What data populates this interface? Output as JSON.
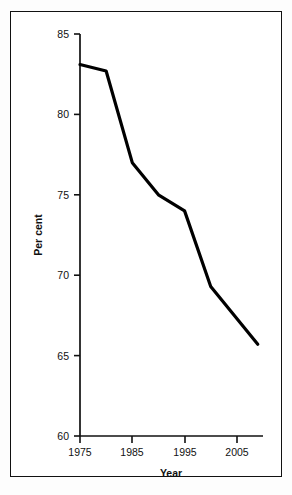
{
  "figure": {
    "frame_color": "#111111",
    "background": "#ffffff"
  },
  "caption_sliver": "",
  "chart_data": {
    "type": "line",
    "title": "",
    "xlabel": "Year",
    "ylabel": "Per cent",
    "xlim": [
      1975,
      2010
    ],
    "ylim": [
      60,
      85
    ],
    "xticks": [
      1975,
      1985,
      1995,
      2005
    ],
    "xtick_labels": [
      "1975",
      "1985",
      "1995",
      "2005"
    ],
    "yticks": [
      60,
      65,
      70,
      75,
      80,
      85
    ],
    "ytick_labels": [
      "60",
      "65",
      "70",
      "75",
      "80",
      "85"
    ],
    "grid": false,
    "legend": false,
    "line_color": "#000000",
    "line_width": 3.2,
    "series": [
      {
        "name": "Per cent",
        "x": [
          1975,
          1980,
          1985,
          1990,
          1995,
          2000,
          2009
        ],
        "values": [
          83.1,
          82.7,
          77.0,
          75.0,
          74.0,
          69.3,
          65.7
        ]
      }
    ]
  }
}
